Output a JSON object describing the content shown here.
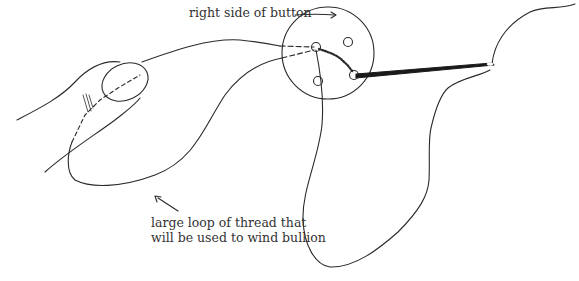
{
  "figure": {
    "labels": {
      "top": "right side of button",
      "bottom_line1": "large loop of thread that",
      "bottom_line2": "will be used to wind bullion"
    },
    "colors": {
      "ink": "#2a2a2a",
      "background": "#ffffff"
    }
  }
}
